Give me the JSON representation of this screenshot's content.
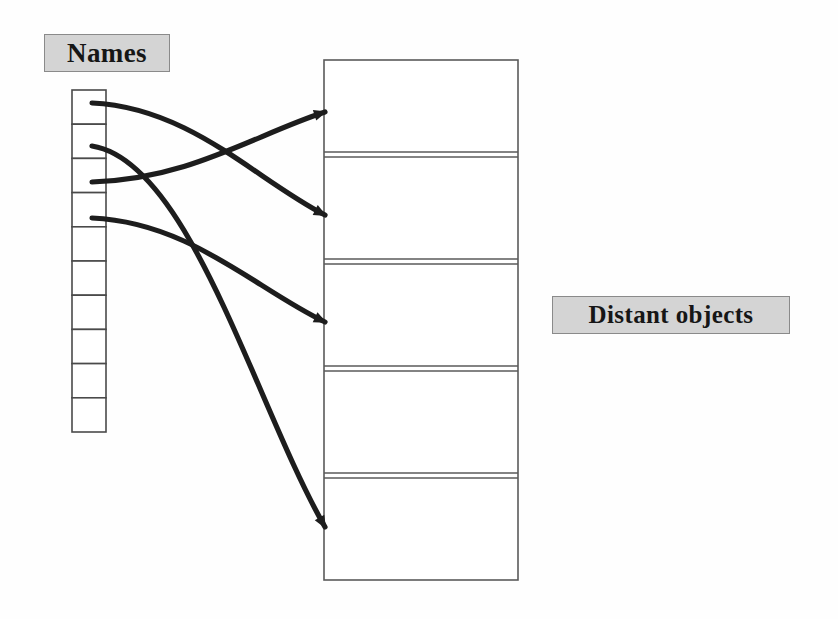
{
  "figure": {
    "background_color": "#fefefe"
  },
  "labels": {
    "names": {
      "text": "Names",
      "bg_color": "#d4d4d4",
      "border_color": "#8a8a8a",
      "text_color": "#161616"
    },
    "distant_objects": {
      "text": "Distant objects",
      "bg_color": "#d4d4d4",
      "border_color": "#8a8a8a",
      "text_color": "#161616"
    }
  },
  "names_column": {
    "cell_count": 10,
    "x": 72,
    "y": 90,
    "width": 34,
    "height": 342,
    "border_color": "#4a4a4a",
    "fill_color": "#ffffff",
    "cells": [
      {
        "index": 1,
        "label": ""
      },
      {
        "index": 2,
        "label": ""
      },
      {
        "index": 3,
        "label": ""
      },
      {
        "index": 4,
        "label": ""
      },
      {
        "index": 5,
        "label": ""
      },
      {
        "index": 6,
        "label": ""
      },
      {
        "index": 7,
        "label": ""
      },
      {
        "index": 8,
        "label": ""
      },
      {
        "index": 9,
        "label": ""
      },
      {
        "index": 10,
        "label": ""
      }
    ]
  },
  "objects_column": {
    "block_count": 5,
    "x": 324,
    "y": 60,
    "width": 194,
    "height": 520,
    "border_color": "#5a5a5a",
    "fill_color": "#ffffff",
    "separator_style": "double-line",
    "separators_y": [
      155,
      262,
      369,
      476
    ],
    "blocks": [
      {
        "index": 1,
        "label": ""
      },
      {
        "index": 2,
        "label": ""
      },
      {
        "index": 3,
        "label": ""
      },
      {
        "index": 4,
        "label": ""
      },
      {
        "index": 5,
        "label": ""
      }
    ]
  },
  "links": [
    {
      "id": "link-1",
      "from_cell": 1,
      "to_block": 2,
      "from_x": 92,
      "from_y": 103,
      "to_x": 325,
      "to_y": 215,
      "color": "#1d1d1d"
    },
    {
      "id": "link-2",
      "from_cell": 2,
      "to_block": 5,
      "from_x": 92,
      "from_y": 146,
      "to_x": 325,
      "to_y": 527,
      "color": "#1d1d1d"
    },
    {
      "id": "link-3",
      "from_cell": 3,
      "to_block": 1,
      "from_x": 92,
      "from_y": 182,
      "to_x": 325,
      "to_y": 112,
      "color": "#1d1d1d"
    },
    {
      "id": "link-4",
      "from_cell": 4,
      "to_block": 3,
      "from_x": 92,
      "from_y": 218,
      "to_x": 325,
      "to_y": 322,
      "color": "#1d1d1d"
    }
  ]
}
